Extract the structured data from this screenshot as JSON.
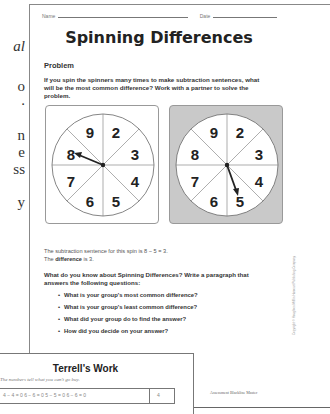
{
  "left_page_fragments": [
    "al",
    "o",
    ".",
    "n",
    "e",
    "ss",
    "y"
  ],
  "worksheet": {
    "name_label": "Name",
    "date_label": "Date",
    "title": "Spinning Differences",
    "problem_heading": "Problem",
    "problem_text": "If you spin the spinners many times to make subtraction sentences, what will be the most common difference? Work with a partner to solve the problem.",
    "spinners": [
      {
        "numbers": [
          "9",
          "2",
          "3",
          "4",
          "5",
          "6",
          "7",
          "8"
        ],
        "pointer_at": "8",
        "background": "#ffffff"
      },
      {
        "numbers": [
          "9",
          "2",
          "3",
          "4",
          "5",
          "6",
          "7",
          "8"
        ],
        "pointer_at": "5",
        "background": "#c9c9c9"
      }
    ],
    "sentence_line1": "The subtraction sentence for this spin is 8 − 5 = 3.",
    "sentence_line2_pre": "The ",
    "sentence_line2_bold": "difference",
    "sentence_line2_post": " is 3.",
    "question": "What do you know about Spinning Differences? Write a paragraph that answers the following questions:",
    "bullets": [
      "What is your group's most common difference?",
      "What is your group's least common difference?",
      "What did your group do to find the answer?",
      "How did you decide on your answer?"
    ],
    "copyright": "Copyright © Houghton Mifflin Harcourt Publishing Company",
    "footer": "Assessment Blackline Master"
  },
  "terrell": {
    "title": "Terrell's Work",
    "subtitle": "The numbers tell what you can't go buy.",
    "row_equations": "4 − 4 = 0  6 − 6 = 0  5 − 5 = 0  6 − 6 = 0",
    "row_count": "4"
  }
}
